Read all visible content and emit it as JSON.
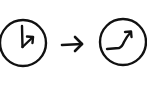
{
  "diagram": {
    "type": "clock-transition",
    "stroke_color": "#111111",
    "background": "#ffffff",
    "left_clock": {
      "icon": "clock-icon",
      "center": [
        23,
        43
      ],
      "radius": 23,
      "hands": "hour hand pointing up, short hand pointing up-right with arrowhead"
    },
    "transition_arrow": {
      "icon": "arrow-right-icon",
      "from": [
        62,
        44
      ],
      "to": [
        83,
        44
      ]
    },
    "right_clock": {
      "icon": "clock-icon",
      "center": [
        123,
        42
      ],
      "radius": 23,
      "hands": "curved hand from left, bending upward to upper-right with arrowhead"
    }
  }
}
